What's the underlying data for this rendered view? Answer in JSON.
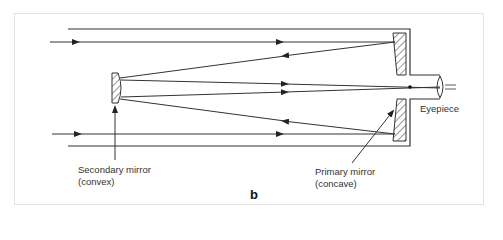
{
  "figure": {
    "type": "Cassegrain reflecting telescope ray diagram",
    "panel_label": "b",
    "labels": {
      "secondary_mirror_line1": "Secondary mirror",
      "secondary_mirror_line2": "(convex)",
      "primary_mirror_line1": "Primary mirror",
      "primary_mirror_line2": "(concave)",
      "eyepiece": "Eyepiece"
    },
    "colors": {
      "line": "#333333",
      "frame_border": "#e3e3e3",
      "background": "#ffffff"
    }
  }
}
